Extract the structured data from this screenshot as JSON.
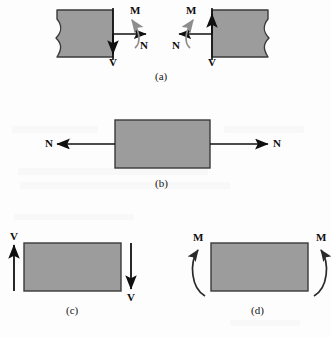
{
  "figure": {
    "background_color": "#fdfdfd",
    "block_fill": "#9c9c9c",
    "block_stroke": "#3a3a3a",
    "arrow_color": "#101010",
    "moment_arrow_color": "#8d8d8d"
  },
  "panels": [
    {
      "id": "a",
      "caption": "(a)",
      "description": "Two cut segments showing equal and opposite N, V and M at the exposed section",
      "labels": [
        {
          "text": "M",
          "force": "moment"
        },
        {
          "text": "N",
          "force": "normal"
        },
        {
          "text": "V",
          "force": "shear"
        },
        {
          "text": "M",
          "force": "moment"
        },
        {
          "text": "N",
          "force": "normal"
        },
        {
          "text": "V",
          "force": "shear"
        }
      ]
    },
    {
      "id": "b",
      "caption": "(b)",
      "description": "Axial normal force N acting outward on both ends",
      "labels": [
        {
          "text": "N",
          "force": "normal"
        },
        {
          "text": "N",
          "force": "normal"
        }
      ]
    },
    {
      "id": "c",
      "caption": "(c)",
      "description": "Shear force V acting up on the left end and down on the right end",
      "labels": [
        {
          "text": "V",
          "force": "shear"
        },
        {
          "text": "V",
          "force": "shear"
        }
      ]
    },
    {
      "id": "d",
      "caption": "(d)",
      "description": "Bending moment M applied as curved arrows at both ends",
      "labels": [
        {
          "text": "M",
          "force": "moment"
        },
        {
          "text": "M",
          "force": "moment"
        }
      ]
    }
  ]
}
